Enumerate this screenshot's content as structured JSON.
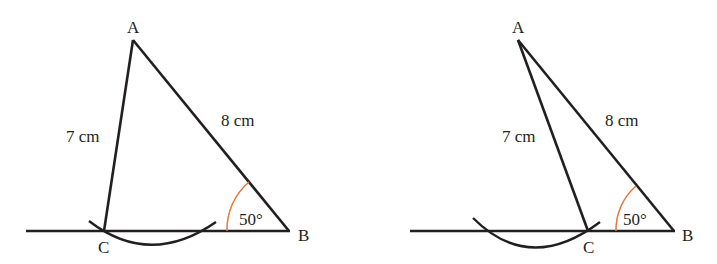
{
  "figures": [
    {
      "id": "left",
      "vertices": {
        "A": "A",
        "B": "B",
        "C": "C"
      },
      "side_AC": "7 cm",
      "side_AB": "8 cm",
      "angle_B": "50°"
    },
    {
      "id": "right",
      "vertices": {
        "A": "A",
        "B": "B",
        "C": "C"
      },
      "side_AC": "7 cm",
      "side_AB": "8 cm",
      "angle_B": "50°"
    }
  ],
  "colors": {
    "line": "#231f20",
    "angle_arc": "#e8743b",
    "background": "#ffffff"
  }
}
